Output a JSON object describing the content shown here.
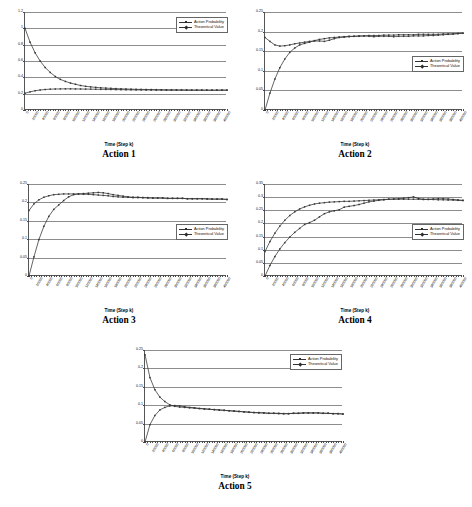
{
  "figure": {
    "x_axis_title": "Time (Step k)",
    "series_names": [
      "Action Probability",
      "Theoretical Value"
    ],
    "x_tick_labels": [
      "0",
      "20000",
      "40000",
      "60000",
      "80000",
      "100000",
      "120000",
      "140000",
      "160000",
      "180000",
      "200000",
      "220000",
      "240000",
      "260000",
      "280000",
      "300000",
      "320000",
      "340000",
      "360000",
      "380000",
      "400000"
    ]
  },
  "chart_data": [
    {
      "type": "line",
      "title": "Action 1",
      "xlabel": "Time (Step k)",
      "ylabel": "",
      "xlim": [
        0,
        400000
      ],
      "ylim": [
        0,
        1.2
      ],
      "yticks": [
        0,
        0.2,
        0.4,
        0.6,
        0.8,
        1,
        1.2
      ],
      "ytick_labels": [
        "0",
        "0.2",
        "0.4",
        "0.6",
        "0.8",
        "1",
        "1.2"
      ],
      "grid": true,
      "legend_position": "top-right",
      "x": [
        0,
        10000,
        20000,
        30000,
        40000,
        50000,
        60000,
        70000,
        80000,
        90000,
        100000,
        110000,
        120000,
        130000,
        140000,
        150000,
        160000,
        170000,
        180000,
        190000,
        200000,
        210000,
        220000,
        230000,
        240000,
        250000,
        260000,
        270000,
        280000,
        290000,
        300000,
        310000,
        320000,
        330000,
        340000,
        350000,
        360000,
        370000,
        380000,
        390000,
        400000
      ],
      "series": [
        {
          "name": "Action Probability",
          "values": [
            1.0,
            0.83,
            0.7,
            0.6,
            0.52,
            0.46,
            0.41,
            0.375,
            0.35,
            0.33,
            0.315,
            0.3,
            0.29,
            0.283,
            0.277,
            0.272,
            0.268,
            0.265,
            0.262,
            0.259,
            0.257,
            0.255,
            0.253,
            0.252,
            0.251,
            0.25,
            0.249,
            0.248,
            0.247,
            0.246,
            0.246,
            0.245,
            0.245,
            0.244,
            0.244,
            0.244,
            0.243,
            0.243,
            0.243,
            0.243,
            0.243
          ]
        },
        {
          "name": "Theoretical Value",
          "values": [
            0.205,
            0.222,
            0.236,
            0.245,
            0.251,
            0.255,
            0.257,
            0.258,
            0.259,
            0.259,
            0.258,
            0.257,
            0.256,
            0.255,
            0.254,
            0.253,
            0.252,
            0.251,
            0.25,
            0.249,
            0.248,
            0.247,
            0.246,
            0.246,
            0.245,
            0.245,
            0.244,
            0.244,
            0.243,
            0.243,
            0.243,
            0.243,
            0.242,
            0.242,
            0.242,
            0.242,
            0.242,
            0.242,
            0.242,
            0.243,
            0.243
          ]
        }
      ]
    },
    {
      "type": "line",
      "title": "Action 2",
      "xlabel": "Time (Step k)",
      "ylabel": "",
      "xlim": [
        0,
        400000
      ],
      "ylim": [
        0,
        0.25
      ],
      "yticks": [
        0,
        0.05,
        0.1,
        0.15,
        0.2,
        0.25
      ],
      "ytick_labels": [
        "0",
        "0.05",
        "0.1",
        "0.15",
        "0.2",
        "0.25"
      ],
      "grid": true,
      "legend_position": "middle-right",
      "x": [
        0,
        10000,
        20000,
        30000,
        40000,
        50000,
        60000,
        70000,
        80000,
        90000,
        100000,
        110000,
        120000,
        130000,
        140000,
        150000,
        160000,
        170000,
        180000,
        190000,
        200000,
        210000,
        220000,
        230000,
        240000,
        250000,
        260000,
        270000,
        280000,
        290000,
        300000,
        310000,
        320000,
        330000,
        340000,
        350000,
        360000,
        370000,
        380000,
        390000,
        400000
      ],
      "series": [
        {
          "name": "Action Probability",
          "values": [
            0.0,
            0.043,
            0.079,
            0.108,
            0.13,
            0.147,
            0.158,
            0.166,
            0.17,
            0.173,
            0.177,
            0.18,
            0.182,
            0.184,
            0.185,
            0.186,
            0.187,
            0.188,
            0.188,
            0.189,
            0.189,
            0.19,
            0.19,
            0.19,
            0.191,
            0.191,
            0.191,
            0.192,
            0.192,
            0.192,
            0.192,
            0.193,
            0.193,
            0.193,
            0.193,
            0.193,
            0.194,
            0.194,
            0.194,
            0.195,
            0.196
          ]
        },
        {
          "name": "Theoretical Value",
          "values": [
            0.185,
            0.175,
            0.166,
            0.163,
            0.164,
            0.166,
            0.169,
            0.171,
            0.173,
            0.175,
            0.176,
            0.176,
            0.175,
            0.178,
            0.182,
            0.185,
            0.186,
            0.187,
            0.188,
            0.188,
            0.189,
            0.188,
            0.187,
            0.188,
            0.188,
            0.188,
            0.187,
            0.188,
            0.188,
            0.188,
            0.189,
            0.189,
            0.189,
            0.19,
            0.19,
            0.191,
            0.192,
            0.193,
            0.194,
            0.195,
            0.196
          ]
        }
      ]
    },
    {
      "type": "line",
      "title": "Action 3",
      "xlabel": "Time (Step k)",
      "ylabel": "",
      "xlim": [
        0,
        400000
      ],
      "ylim": [
        0,
        0.25
      ],
      "yticks": [
        0,
        0.05,
        0.1,
        0.15,
        0.2,
        0.25
      ],
      "ytick_labels": [
        "0",
        "0.05",
        "0.1",
        "0.15",
        "0.2",
        "0.25"
      ],
      "grid": true,
      "legend_position": "middle-right",
      "x": [
        0,
        10000,
        20000,
        30000,
        40000,
        50000,
        60000,
        70000,
        80000,
        90000,
        100000,
        110000,
        120000,
        130000,
        140000,
        150000,
        160000,
        170000,
        180000,
        190000,
        200000,
        210000,
        220000,
        230000,
        240000,
        250000,
        260000,
        270000,
        280000,
        290000,
        300000,
        310000,
        320000,
        330000,
        340000,
        350000,
        360000,
        370000,
        380000,
        390000,
        400000
      ],
      "series": [
        {
          "name": "Action Probability",
          "values": [
            0.0,
            0.052,
            0.099,
            0.135,
            0.162,
            0.181,
            0.193,
            0.205,
            0.215,
            0.221,
            0.223,
            0.224,
            0.225,
            0.226,
            0.227,
            0.226,
            0.224,
            0.221,
            0.219,
            0.217,
            0.215,
            0.214,
            0.214,
            0.213,
            0.213,
            0.212,
            0.212,
            0.212,
            0.211,
            0.211,
            0.211,
            0.211,
            0.21,
            0.21,
            0.21,
            0.21,
            0.21,
            0.209,
            0.209,
            0.209,
            0.208
          ]
        },
        {
          "name": "Theoretical Value",
          "values": [
            0.178,
            0.196,
            0.207,
            0.214,
            0.218,
            0.221,
            0.222,
            0.223,
            0.223,
            0.223,
            0.223,
            0.222,
            0.222,
            0.221,
            0.22,
            0.219,
            0.218,
            0.216,
            0.215,
            0.214,
            0.214,
            0.213,
            0.213,
            0.213,
            0.212,
            0.212,
            0.212,
            0.212,
            0.211,
            0.211,
            0.211,
            0.211,
            0.21,
            0.21,
            0.21,
            0.21,
            0.209,
            0.209,
            0.209,
            0.209,
            0.208
          ]
        }
      ]
    },
    {
      "type": "line",
      "title": "Action 4",
      "xlabel": "Time (Step k)",
      "ylabel": "",
      "xlim": [
        0,
        400000
      ],
      "ylim": [
        0,
        0.35
      ],
      "yticks": [
        0,
        0.05,
        0.1,
        0.15,
        0.2,
        0.25,
        0.3,
        0.35
      ],
      "ytick_labels": [
        "0",
        "0.05",
        "0.1",
        "0.15",
        "0.2",
        "0.25",
        "0.3",
        "0.35"
      ],
      "grid": true,
      "legend_position": "middle-right",
      "x": [
        0,
        10000,
        20000,
        30000,
        40000,
        50000,
        60000,
        70000,
        80000,
        90000,
        100000,
        110000,
        120000,
        130000,
        140000,
        150000,
        160000,
        170000,
        180000,
        190000,
        200000,
        210000,
        220000,
        230000,
        240000,
        250000,
        260000,
        270000,
        280000,
        290000,
        300000,
        310000,
        320000,
        330000,
        340000,
        350000,
        360000,
        370000,
        380000,
        390000,
        400000
      ],
      "series": [
        {
          "name": "Action Probability",
          "values": [
            0.0,
            0.04,
            0.074,
            0.103,
            0.127,
            0.148,
            0.166,
            0.181,
            0.196,
            0.203,
            0.212,
            0.225,
            0.237,
            0.244,
            0.248,
            0.252,
            0.262,
            0.265,
            0.268,
            0.272,
            0.277,
            0.282,
            0.285,
            0.288,
            0.29,
            0.292,
            0.293,
            0.294,
            0.296,
            0.298,
            0.301,
            0.295,
            0.292,
            0.292,
            0.293,
            0.294,
            0.294,
            0.293,
            0.291,
            0.289,
            0.288
          ]
        },
        {
          "name": "Theoretical Value",
          "values": [
            0.093,
            0.131,
            0.163,
            0.19,
            0.212,
            0.23,
            0.244,
            0.255,
            0.263,
            0.269,
            0.274,
            0.277,
            0.279,
            0.281,
            0.282,
            0.283,
            0.284,
            0.284,
            0.285,
            0.286,
            0.287,
            0.288,
            0.289,
            0.29,
            0.291,
            0.292,
            0.292,
            0.292,
            0.292,
            0.292,
            0.292,
            0.292,
            0.291,
            0.291,
            0.291,
            0.29,
            0.29,
            0.289,
            0.289,
            0.288,
            0.287
          ]
        }
      ]
    },
    {
      "type": "line",
      "title": "Action 5",
      "xlabel": "Time (Step k)",
      "ylabel": "",
      "xlim": [
        0,
        400000
      ],
      "ylim": [
        0,
        0.25
      ],
      "yticks": [
        0,
        0.05,
        0.1,
        0.15,
        0.2,
        0.25
      ],
      "ytick_labels": [
        "0",
        "0.05",
        "0.1",
        "0.15",
        "0.2",
        "0.25"
      ],
      "grid": true,
      "legend_position": "top-right",
      "x": [
        0,
        10000,
        20000,
        30000,
        40000,
        50000,
        60000,
        70000,
        80000,
        90000,
        100000,
        110000,
        120000,
        130000,
        140000,
        150000,
        160000,
        170000,
        180000,
        190000,
        200000,
        210000,
        220000,
        230000,
        240000,
        250000,
        260000,
        270000,
        280000,
        290000,
        300000,
        310000,
        320000,
        330000,
        340000,
        350000,
        360000,
        370000,
        380000,
        390000,
        400000
      ],
      "series": [
        {
          "name": "Action Probability",
          "values": [
            0.237,
            0.175,
            0.142,
            0.122,
            0.11,
            0.101,
            0.097,
            0.095,
            0.094,
            0.093,
            0.092,
            0.091,
            0.09,
            0.089,
            0.088,
            0.087,
            0.086,
            0.085,
            0.084,
            0.083,
            0.082,
            0.081,
            0.08,
            0.079,
            0.079,
            0.078,
            0.078,
            0.077,
            0.077,
            0.077,
            0.078,
            0.078,
            0.079,
            0.079,
            0.079,
            0.079,
            0.078,
            0.078,
            0.077,
            0.077,
            0.076
          ]
        },
        {
          "name": "Theoretical Value",
          "values": [
            0.0,
            0.047,
            0.072,
            0.087,
            0.094,
            0.098,
            0.099,
            0.098,
            0.096,
            0.094,
            0.093,
            0.091,
            0.09,
            0.089,
            0.088,
            0.087,
            0.086,
            0.085,
            0.084,
            0.083,
            0.082,
            0.081,
            0.08,
            0.08,
            0.079,
            0.078,
            0.078,
            0.078,
            0.077,
            0.077,
            0.078,
            0.078,
            0.079,
            0.079,
            0.079,
            0.079,
            0.078,
            0.078,
            0.077,
            0.077,
            0.076
          ]
        }
      ]
    }
  ]
}
